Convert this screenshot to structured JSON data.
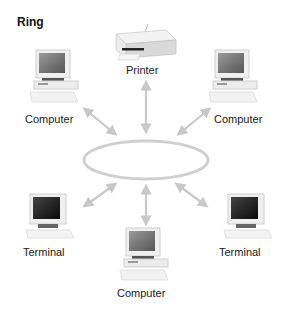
{
  "diagram": {
    "title": "Ring",
    "type": "network-topology",
    "hub": {
      "shape": "ellipse",
      "label": ""
    },
    "nodes": [
      {
        "id": "printer",
        "label": "Printer",
        "kind": "printer-icon"
      },
      {
        "id": "computer-top-left",
        "label": "Computer",
        "kind": "computer-icon"
      },
      {
        "id": "computer-top-right",
        "label": "Computer",
        "kind": "computer-icon"
      },
      {
        "id": "terminal-bottom-left",
        "label": "Terminal",
        "kind": "terminal-icon"
      },
      {
        "id": "computer-bottom",
        "label": "Computer",
        "kind": "computer-icon"
      },
      {
        "id": "terminal-bottom-right",
        "label": "Terminal",
        "kind": "terminal-icon"
      }
    ],
    "connections": [
      {
        "from": "printer",
        "to": "ring",
        "arrow": "bidirectional"
      },
      {
        "from": "computer-top-left",
        "to": "ring",
        "arrow": "bidirectional"
      },
      {
        "from": "computer-top-right",
        "to": "ring",
        "arrow": "bidirectional"
      },
      {
        "from": "terminal-bottom-left",
        "to": "ring",
        "arrow": "bidirectional"
      },
      {
        "from": "computer-bottom",
        "to": "ring",
        "arrow": "bidirectional"
      },
      {
        "from": "terminal-bottom-right",
        "to": "ring",
        "arrow": "bidirectional"
      }
    ],
    "colors": {
      "ring": "#cfcfcf",
      "arrow": "#c8c8c8",
      "screen_computer": "#6e6e6e",
      "screen_terminal": "#1a1a1a",
      "casing": "#eeeeee"
    }
  }
}
